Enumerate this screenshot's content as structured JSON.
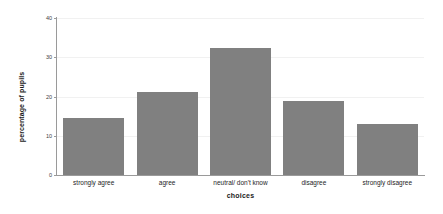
{
  "chart_data": {
    "type": "bar",
    "title": "",
    "subtitle": "",
    "categories": [
      "strongly agree",
      "agree",
      "neutral/ don't know",
      "disagree",
      "strongly disagree"
    ],
    "values": [
      14.5,
      21.2,
      32.3,
      18.8,
      13.0
    ],
    "xlabel": "choices",
    "ylabel": "percentage of pupils",
    "ylim": [
      0,
      40
    ],
    "yticks": [
      0,
      10,
      20,
      30,
      40
    ],
    "ytick_labels": [
      "0",
      "10",
      "20",
      "30",
      "40"
    ],
    "grid": true,
    "grid_axis": "y",
    "legend": false,
    "legend_position": "none",
    "bar_color": "#808080",
    "background_color": "#ffffff",
    "axis_color": "#9a9a9a",
    "gridline_color": "#f1f1f1",
    "text_color": "#1a1a1a"
  }
}
